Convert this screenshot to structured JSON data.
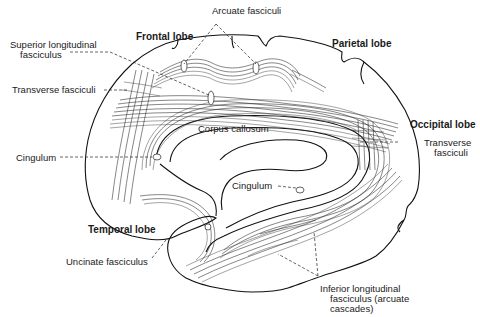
{
  "diagram": {
    "type": "anatomical-illustration",
    "lobes": [
      {
        "id": "frontal",
        "label": "Frontal lobe"
      },
      {
        "id": "parietal",
        "label": "Parietal lobe"
      },
      {
        "id": "occipital",
        "label": "Occipital lobe"
      },
      {
        "id": "temporal",
        "label": "Temporal lobe"
      }
    ],
    "structures": [
      {
        "id": "arcuate",
        "label": "Arcuate fasciculi"
      },
      {
        "id": "slf_line1",
        "label": "Superior longitudinal"
      },
      {
        "id": "slf_line2",
        "label": "fasciculus"
      },
      {
        "id": "transverse_left",
        "label": "Transverse fasciculi"
      },
      {
        "id": "corpus_callosum",
        "label": "Corpus callosum"
      },
      {
        "id": "cingulum_left",
        "label": "Cingulum"
      },
      {
        "id": "cingulum_center",
        "label": "Cingulum"
      },
      {
        "id": "transverse_right_line1",
        "label": "Transverse"
      },
      {
        "id": "transverse_right_line2",
        "label": "fasciculi"
      },
      {
        "id": "uncinate",
        "label": "Uncinate fasciculus"
      },
      {
        "id": "ilf_line1",
        "label": "Inferior longitudinal"
      },
      {
        "id": "ilf_line2",
        "label": "fasciculus (arcuate"
      },
      {
        "id": "ilf_line3",
        "label": "cascades)"
      }
    ]
  }
}
